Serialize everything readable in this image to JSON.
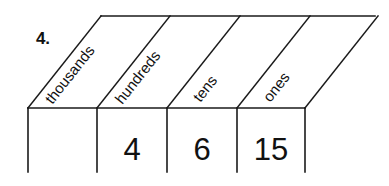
{
  "item": {
    "number_label": "4.",
    "type": "place-value-chart"
  },
  "chart": {
    "columns": [
      {
        "label": "thousands",
        "value": ""
      },
      {
        "label": "hundreds",
        "value": "4"
      },
      {
        "label": "tens",
        "value": "6"
      },
      {
        "label": "ones",
        "value": "15"
      }
    ],
    "line_color": "#1a1a1a",
    "background_color": "#ffffff",
    "text_color": "#111111"
  }
}
